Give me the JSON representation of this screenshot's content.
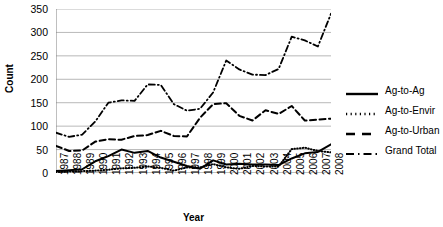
{
  "chart_data": {
    "type": "line",
    "title": "",
    "xlabel": "Year",
    "ylabel": "Count",
    "grid": true,
    "legend_position": "right",
    "ylim": [
      0,
      350
    ],
    "yticks": [
      0,
      50,
      100,
      150,
      200,
      250,
      300,
      350
    ],
    "categories": [
      "1987",
      "1988",
      "1989",
      "1990",
      "1991",
      "1992",
      "1993",
      "1994",
      "1995",
      "1996",
      "1997",
      "1998",
      "1999",
      "2000",
      "2001",
      "2002",
      "2003",
      "2004",
      "2005",
      "2006",
      "2007",
      "2008"
    ],
    "series": [
      {
        "name": "Ag-to-Ag",
        "style": "solid",
        "color": "#000000",
        "values": [
          4,
          6,
          8,
          25,
          36,
          50,
          43,
          47,
          33,
          24,
          15,
          9,
          27,
          18,
          20,
          18,
          18,
          17,
          31,
          42,
          45,
          61
        ]
      },
      {
        "name": "Ag-to-Envir",
        "style": "dotted",
        "color": "#000000",
        "values": [
          2,
          3,
          4,
          5,
          7,
          10,
          11,
          14,
          11,
          5,
          12,
          12,
          19,
          12,
          9,
          15,
          14,
          14,
          51,
          54,
          47,
          44
        ]
      },
      {
        "name": "Ag-to-Urban",
        "style": "dashed",
        "color": "#000000",
        "values": [
          58,
          47,
          48,
          67,
          72,
          71,
          79,
          81,
          90,
          79,
          78,
          118,
          147,
          149,
          122,
          112,
          134,
          126,
          143,
          112,
          114,
          116
        ]
      },
      {
        "name": "Grand Total",
        "style": "dashdot",
        "color": "#000000",
        "values": [
          86,
          77,
          82,
          110,
          150,
          155,
          154,
          189,
          188,
          147,
          133,
          137,
          172,
          240,
          221,
          210,
          209,
          222,
          291,
          283,
          270,
          340
        ]
      }
    ]
  },
  "axes": {
    "y_title": "Count",
    "x_title": "Year"
  },
  "legend": {
    "items": [
      {
        "label": "Ag-to-Ag",
        "swatch": "solid-line-swatch"
      },
      {
        "label": "Ag-to-Envir",
        "swatch": "dotted-line-swatch"
      },
      {
        "label": "Ag-to-Urban",
        "swatch": "dashed-line-swatch"
      },
      {
        "label": "Grand Total",
        "swatch": "dashdot-line-swatch"
      }
    ]
  }
}
